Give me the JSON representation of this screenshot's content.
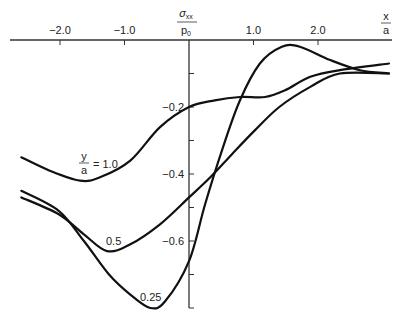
{
  "chart_data": {
    "type": "line",
    "title": "",
    "xlabel": {
      "numerator": "x",
      "denominator": "a"
    },
    "ylabel": {
      "numerator": "σxx",
      "numerator_main": "σ",
      "numerator_sub": "xx",
      "denominator": "p",
      "denominator_sub": "0"
    },
    "xlim": [
      -2.8,
      3.15
    ],
    "ylim": [
      -0.82,
      0.0
    ],
    "x_ticks": [
      -2.0,
      -1.0,
      1.0,
      2.0
    ],
    "x_tick_labels": [
      "−2.0",
      "−1.0",
      "1.0",
      "2.0"
    ],
    "y_ticks": [
      -0.1,
      -0.2,
      -0.3,
      -0.4,
      -0.5,
      -0.6,
      -0.7,
      -0.8
    ],
    "y_tick_labels": {
      "-0.2": "−0.2",
      "-0.4": "−0.4",
      "-0.6": "−0.6"
    },
    "grid": false,
    "legend": "inline curve labels",
    "series": [
      {
        "name": "y/a = 1.0",
        "label": {
          "fraction_num": "y",
          "fraction_den": "a",
          "suffix": "= 1.0"
        },
        "x": [
          -2.6,
          -2.16,
          -1.69,
          -1.38,
          -0.91,
          -0.45,
          0.0,
          0.4,
          0.79,
          1.18,
          1.49,
          1.88,
          2.34,
          3.1
        ],
        "y": [
          -0.35,
          -0.39,
          -0.42,
          -0.41,
          -0.36,
          -0.26,
          -0.2,
          -0.18,
          -0.17,
          -0.17,
          -0.15,
          -0.11,
          -0.09,
          -0.07
        ]
      },
      {
        "name": "y/a = 0.5",
        "label": {
          "text": "0.5"
        },
        "x": [
          -2.6,
          -2.02,
          -1.63,
          -1.27,
          -0.91,
          -0.45,
          0.0,
          0.33,
          0.67,
          1.02,
          1.4,
          1.88,
          2.34,
          3.1
        ],
        "y": [
          -0.47,
          -0.52,
          -0.58,
          -0.63,
          -0.61,
          -0.55,
          -0.47,
          -0.41,
          -0.34,
          -0.27,
          -0.2,
          -0.14,
          -0.1,
          -0.1
        ]
      },
      {
        "name": "y/a = 0.25",
        "label": {
          "text": "0.25"
        },
        "x": [
          -2.6,
          -2.02,
          -1.63,
          -1.24,
          -0.91,
          -0.6,
          -0.37,
          0.0,
          0.25,
          0.51,
          0.79,
          1.1,
          1.44,
          1.72,
          2.19,
          2.65,
          3.1
        ],
        "y": [
          -0.45,
          -0.51,
          -0.6,
          -0.7,
          -0.76,
          -0.8,
          -0.78,
          -0.66,
          -0.49,
          -0.33,
          -0.18,
          -0.07,
          -0.02,
          -0.02,
          -0.06,
          -0.09,
          -0.1
        ]
      }
    ]
  },
  "colors": {
    "line": "#111111",
    "axis": "#333333",
    "background": "#ffffff"
  }
}
